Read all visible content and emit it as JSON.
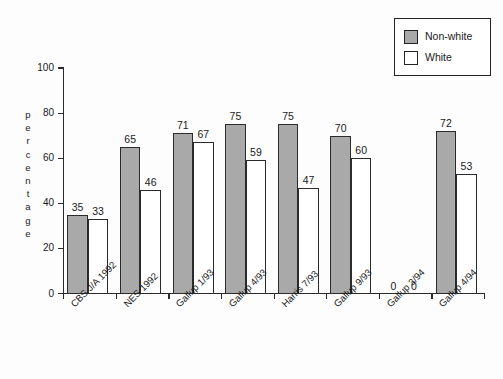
{
  "chart_data": {
    "type": "bar",
    "title": "",
    "xlabel": "",
    "ylabel": "percentage",
    "ylim": [
      0,
      100
    ],
    "ytick_labels": [
      "100",
      "80",
      "60",
      "40",
      "20",
      "0"
    ],
    "ytick_values": [
      100,
      80,
      60,
      40,
      20,
      0
    ],
    "grid": false,
    "legend_position": "top-right",
    "categories": [
      "CBS J/A 1992",
      "NES 1992",
      "Gallup 1/93",
      "Gallup 4/93",
      "Harris 7/93",
      "Gallup 9/93",
      "Gallup 3/94",
      "Gallup 4/94"
    ],
    "series": [
      {
        "name": "Non-white",
        "color": "#a9a9a9",
        "values": [
          35,
          65,
          71,
          75,
          75,
          70,
          0,
          72
        ],
        "labels": [
          "35",
          "65",
          "71",
          "75",
          "75",
          "70",
          "0",
          "72"
        ]
      },
      {
        "name": "White",
        "color": "#ffffff",
        "values": [
          33,
          46,
          67,
          59,
          47,
          60,
          0,
          53
        ],
        "labels": [
          "33",
          "46",
          "67",
          "59",
          "47",
          "60",
          "0",
          "53"
        ]
      }
    ]
  },
  "legend": {
    "entries": [
      {
        "label": "Non-white",
        "swatch": "nonwhite"
      },
      {
        "label": "White",
        "swatch": "white"
      }
    ]
  },
  "axis_title_letters": [
    "p",
    "e",
    "r",
    "c",
    "e",
    "n",
    "t",
    "a",
    "g",
    "e"
  ]
}
